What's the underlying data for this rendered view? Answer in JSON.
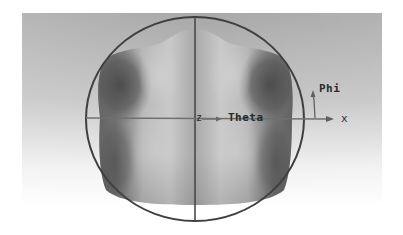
{
  "figure": {
    "type": "3d-radiation-pattern-view",
    "labels": {
      "z_axis": "z",
      "theta": "Theta",
      "phi": "Phi",
      "x_axis": "x"
    },
    "colors": {
      "panel_top": "#a9a9a9",
      "panel_bottom": "#ffffff",
      "circle_stroke": "#3f3f3f",
      "axis_line": "#6e6e6e",
      "pattern_light": "#c8c8c8",
      "pattern_dark": "#585858",
      "label_text": "#2a2a2a"
    }
  }
}
